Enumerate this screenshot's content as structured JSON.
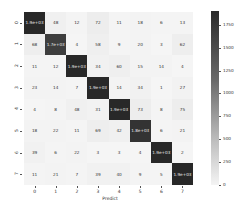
{
  "chart_data": {
    "type": "heatmap",
    "title": "",
    "xlabel": "Predict",
    "ylabel": "",
    "x_categories": [
      "0",
      "1",
      "2",
      "3",
      "4",
      "5",
      "6",
      "7"
    ],
    "y_categories": [
      "0",
      "1",
      "2",
      "3",
      "4",
      "5",
      "6",
      "7"
    ],
    "values": [
      [
        1900,
        48,
        12,
        72,
        11,
        18,
        6,
        13
      ],
      [
        68,
        1700,
        4,
        58,
        9,
        20,
        3,
        62
      ],
      [
        11,
        12,
        1900,
        34,
        60,
        15,
        14,
        4
      ],
      [
        23,
        14,
        7,
        1900,
        14,
        34,
        1,
        27
      ],
      [
        4,
        8,
        48,
        31,
        1900,
        73,
        8,
        75
      ],
      [
        18,
        22,
        11,
        69,
        42,
        1800,
        6,
        21
      ],
      [
        39,
        6,
        22,
        3,
        3,
        4,
        1900,
        2
      ],
      [
        11,
        21,
        7,
        39,
        40,
        9,
        5,
        1900
      ]
    ],
    "labels": [
      [
        "1.9e+03",
        "48",
        "12",
        "72",
        "11",
        "18",
        "6",
        "13"
      ],
      [
        "68",
        "1.7e+03",
        "4",
        "58",
        "9",
        "20",
        "3",
        "62"
      ],
      [
        "11",
        "12",
        "1.9e+03",
        "34",
        "60",
        "15",
        "14",
        "4"
      ],
      [
        "23",
        "14",
        "7",
        "1.9e+03",
        "14",
        "34",
        "1",
        "27"
      ],
      [
        "4",
        "8",
        "48",
        "31",
        "1.9e+03",
        "73",
        "8",
        "75"
      ],
      [
        "18",
        "22",
        "11",
        "69",
        "42",
        "1.8e+03",
        "6",
        "21"
      ],
      [
        "39",
        "6",
        "22",
        "3",
        "3",
        "4",
        "1.9e+03",
        "2"
      ],
      [
        "11",
        "21",
        "7",
        "39",
        "40",
        "9",
        "5",
        "1.9e+03"
      ]
    ],
    "colorbar": {
      "min": 0,
      "max": 1900,
      "ticks": [
        "0",
        "250",
        "500",
        "750",
        "1000",
        "1250",
        "1500",
        "1750"
      ]
    },
    "colormap": "Greys"
  }
}
